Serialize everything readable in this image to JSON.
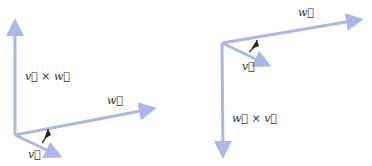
{
  "colors": {
    "arrow": "#a9b8e8",
    "arrow_edge": "#8d9fdb",
    "angle_marker": "#222222",
    "label": "#333333"
  },
  "left_figure": {
    "labels": {
      "cross": "v⃗ × w⃗",
      "w": "w⃗",
      "v": "v⃗"
    },
    "vectors": [
      "v×w (up)",
      "w (right)",
      "v (down-right)"
    ]
  },
  "right_figure": {
    "labels": {
      "cross": "w⃗ × v⃗",
      "w": "w⃗",
      "v": "v⃗"
    },
    "vectors": [
      "w×v (down)",
      "w (right)",
      "v (down-right)"
    ]
  }
}
